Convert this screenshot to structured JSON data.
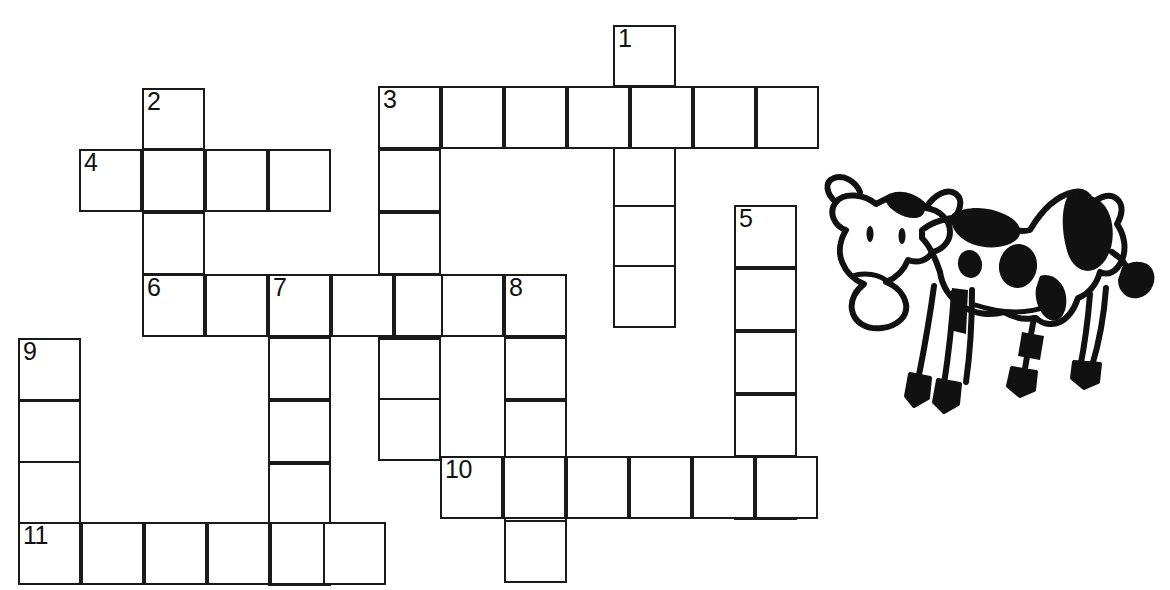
{
  "page": {
    "background_color": "#ffffff",
    "grid_line_color": "#1a1a1a",
    "width": 1170,
    "height": 590
  },
  "crossword": {
    "cell_size": 63,
    "numbers_visible": [
      "1",
      "2",
      "3",
      "4",
      "5",
      "6",
      "7",
      "8",
      "9",
      "10",
      "11"
    ],
    "entries": [
      {
        "number": "1",
        "direction": "down",
        "length": 5,
        "start_x": 613,
        "start_y": 25
      },
      {
        "number": "2",
        "direction": "down",
        "length": 4,
        "start_x": 142,
        "start_y": 88
      },
      {
        "number": "3",
        "direction": "across",
        "length": 7,
        "start_x": 378,
        "start_y": 86
      },
      {
        "number": "3",
        "direction": "down",
        "length": 6,
        "start_x": 378,
        "start_y": 86
      },
      {
        "number": "4",
        "direction": "across",
        "length": 4,
        "start_x": 79,
        "start_y": 149
      },
      {
        "number": "5",
        "direction": "down",
        "length": 5,
        "start_x": 734,
        "start_y": 205
      },
      {
        "number": "6",
        "direction": "across",
        "length": 7,
        "start_x": 142,
        "start_y": 274
      },
      {
        "number": "7",
        "direction": "down",
        "length": 5,
        "start_x": 263,
        "start_y": 274
      },
      {
        "number": "8",
        "direction": "down",
        "length": 5,
        "start_x": 503,
        "start_y": 274
      },
      {
        "number": "9",
        "direction": "down",
        "length": 4,
        "start_x": 18,
        "start_y": 338
      },
      {
        "number": "10",
        "direction": "across",
        "length": 6,
        "start_x": 440,
        "start_y": 456
      },
      {
        "number": "11",
        "direction": "across",
        "length": 6,
        "start_x": 18,
        "start_y": 522
      }
    ],
    "cells": [
      {
        "x": 613,
        "y": 25,
        "number": "1"
      },
      {
        "x": 613,
        "y": 85
      },
      {
        "x": 613,
        "y": 145
      },
      {
        "x": 613,
        "y": 205
      },
      {
        "x": 613,
        "y": 265
      },
      {
        "x": 142,
        "y": 88,
        "number": "2"
      },
      {
        "x": 142,
        "y": 148
      },
      {
        "x": 142,
        "y": 212
      },
      {
        "x": 378,
        "y": 86,
        "number": "3"
      },
      {
        "x": 441,
        "y": 86
      },
      {
        "x": 504,
        "y": 86
      },
      {
        "x": 567,
        "y": 86
      },
      {
        "x": 630,
        "y": 86
      },
      {
        "x": 693,
        "y": 86
      },
      {
        "x": 756,
        "y": 86
      },
      {
        "x": 378,
        "y": 149
      },
      {
        "x": 378,
        "y": 212
      },
      {
        "x": 378,
        "y": 275
      },
      {
        "x": 378,
        "y": 338
      },
      {
        "x": 378,
        "y": 398
      },
      {
        "x": 79,
        "y": 149,
        "number": "4"
      },
      {
        "x": 142,
        "y": 149
      },
      {
        "x": 205,
        "y": 149
      },
      {
        "x": 268,
        "y": 149
      },
      {
        "x": 734,
        "y": 205,
        "number": "5"
      },
      {
        "x": 734,
        "y": 268
      },
      {
        "x": 734,
        "y": 331
      },
      {
        "x": 734,
        "y": 394
      },
      {
        "x": 734,
        "y": 457
      },
      {
        "x": 142,
        "y": 274,
        "number": "6"
      },
      {
        "x": 205,
        "y": 274
      },
      {
        "x": 268,
        "y": 274,
        "number": "7"
      },
      {
        "x": 331,
        "y": 274
      },
      {
        "x": 394,
        "y": 274
      },
      {
        "x": 441,
        "y": 274
      },
      {
        "x": 504,
        "y": 274,
        "number": "8"
      },
      {
        "x": 268,
        "y": 337
      },
      {
        "x": 268,
        "y": 400
      },
      {
        "x": 268,
        "y": 463
      },
      {
        "x": 268,
        "y": 523
      },
      {
        "x": 504,
        "y": 337
      },
      {
        "x": 504,
        "y": 400
      },
      {
        "x": 504,
        "y": 460
      },
      {
        "x": 504,
        "y": 520
      },
      {
        "x": 18,
        "y": 338,
        "number": "9"
      },
      {
        "x": 18,
        "y": 400
      },
      {
        "x": 18,
        "y": 461
      },
      {
        "x": 440,
        "y": 456,
        "number": "10"
      },
      {
        "x": 503,
        "y": 456
      },
      {
        "x": 566,
        "y": 456
      },
      {
        "x": 629,
        "y": 456
      },
      {
        "x": 692,
        "y": 456
      },
      {
        "x": 755,
        "y": 456
      },
      {
        "x": 18,
        "y": 522,
        "number": "11"
      },
      {
        "x": 81,
        "y": 522
      },
      {
        "x": 144,
        "y": 522
      },
      {
        "x": 207,
        "y": 522
      },
      {
        "x": 270,
        "y": 522
      },
      {
        "x": 323,
        "y": 522
      }
    ]
  },
  "illustration": {
    "name": "cow-drawing",
    "description": "Hand-drawn black and white spotted cow",
    "fill_color": "#111111",
    "outline_color": "#111111"
  }
}
